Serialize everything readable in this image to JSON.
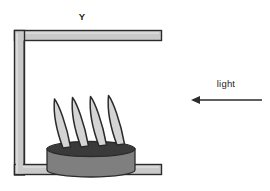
{
  "diagram": {
    "title_label": "Y",
    "light_label": "light",
    "colors": {
      "frame_fill": "#c9c9c9",
      "frame_stroke": "#2b2b2b",
      "pedestal_body": "#7f7f7f",
      "pedestal_top": "#3a3a3a",
      "blade_fill": "#d4d4d4",
      "blade_stroke": "#2b2b2b",
      "arrow": "#2b2b2b",
      "text": "#231f20",
      "background": "#ffffff"
    },
    "frame": {
      "name": "c-shaped-bracket",
      "top_bar": {
        "x": 14,
        "y": 30,
        "width": 148,
        "height": 10
      },
      "left_bar": {
        "x": 14,
        "y": 30,
        "width": 10,
        "height": 145
      },
      "bottom_bar": {
        "x": 14,
        "y": 165,
        "width": 148,
        "height": 10
      }
    },
    "pedestal": {
      "name": "cylindrical-pedestal",
      "center_x": 91,
      "top_ellipse_y": 149,
      "radius_x": 44,
      "radius_y": 7,
      "body_bottom_y": 170
    },
    "blades": [
      {
        "index": 1,
        "base_x": 62,
        "tip_x": 52,
        "tip_y": 98
      },
      {
        "index": 2,
        "base_x": 80,
        "tip_x": 70,
        "tip_y": 96
      },
      {
        "index": 3,
        "base_x": 98,
        "tip_x": 88,
        "tip_y": 95
      },
      {
        "index": 4,
        "base_x": 116,
        "tip_x": 106,
        "tip_y": 94
      }
    ],
    "arrow": {
      "name": "light-direction-arrow",
      "direction": "left",
      "tail_x": 262,
      "head_x": 192,
      "y": 100
    }
  }
}
